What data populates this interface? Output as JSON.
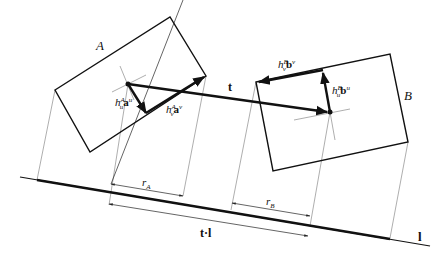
{
  "figure": {
    "boxes": {
      "A": {
        "label": "A"
      },
      "B": {
        "label": "B"
      }
    },
    "vectors": {
      "t": {
        "label": "t"
      },
      "hAu": {
        "h": "h",
        "sub": "u",
        "sup": "A",
        "vec": "a",
        "vec_sup": "u"
      },
      "hAv": {
        "h": "h",
        "sub": "v",
        "sup": "A",
        "vec": "a",
        "vec_sup": "v"
      },
      "hBv": {
        "h": "h",
        "sub": "v",
        "sup": "B",
        "vec": "b",
        "vec_sup": "v"
      },
      "hBu": {
        "h": "h",
        "sub": "u",
        "sup": "B",
        "vec": "b",
        "vec_sup": "u"
      }
    },
    "dimensions": {
      "rA": {
        "r": "r",
        "sub": "A"
      },
      "rB": {
        "r": "r",
        "sub": "B"
      },
      "tl": {
        "label": "t·l"
      }
    },
    "axis": {
      "label": "l"
    },
    "colors": {
      "ink": "#111111",
      "thin": "#777777",
      "background": "#ffffff"
    }
  }
}
